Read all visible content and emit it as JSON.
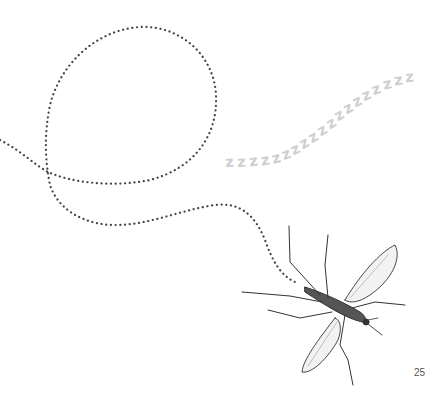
{
  "page": {
    "type": "book-illustration-page",
    "page_number": "25"
  },
  "illustration": {
    "subject": "mosquito",
    "flight_path": "dotted looping line",
    "snore_text": {
      "letters": [
        "z",
        "z",
        "z",
        "z",
        "z",
        "z",
        "z",
        "z",
        "z",
        "z",
        "z",
        "z",
        "z",
        "z",
        "z",
        "z",
        "z",
        "z",
        "z"
      ],
      "color": "#cfcfcf"
    },
    "path_color": "#444444",
    "sketch_color": "#333333"
  }
}
